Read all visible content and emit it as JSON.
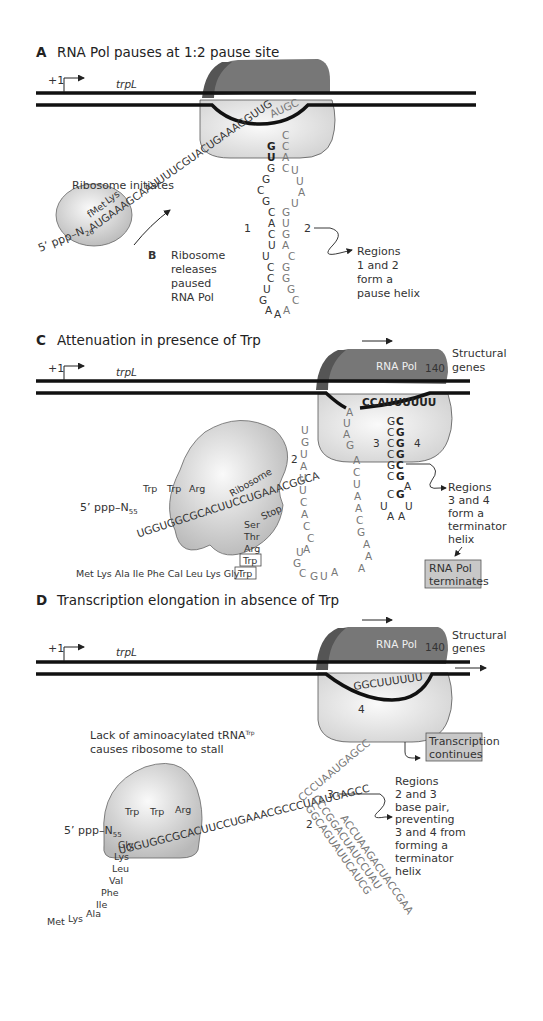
{
  "panels": {
    "A": {
      "letter": "A",
      "title": "RNA Pol pauses at 1:2 pause site",
      "plus_one": "+1",
      "gene": "trpL",
      "pol_seq": "AUGC",
      "transcript": "5’ ppp–N",
      "n_sub": "26",
      "strand_seq": "AUGAAAGCAAUUUUCGUACUGAAAGGUUG",
      "codon_labels": [
        "fMet",
        "Lys"
      ],
      "ribosome_label": "Ribosome initiates",
      "region1": "1",
      "region2": "2",
      "note": [
        "Regions",
        "1 and 2",
        "form a",
        "pause helix"
      ]
    },
    "B": {
      "letter": "B",
      "text": [
        "Ribosome",
        "releases",
        "paused",
        "RNA Pol"
      ]
    },
    "C": {
      "letter": "C",
      "title": "Attenuation in presence of Trp",
      "plus_one": "+1",
      "gene": "trpL",
      "pol_label": "RNA Pol",
      "pos": "140",
      "structural": [
        "Structural",
        "genes"
      ],
      "pol_seq": "CCAUUUUUU",
      "ribosome_label": "Ribosome",
      "transcript": "5’ ppp–N",
      "n_sub": "55",
      "seq": "UGGUGGCGCACUUCCUGAAACGGCA",
      "codons_top": [
        "Trp",
        "Trp",
        "Arg"
      ],
      "codons_right": [
        "Stop"
      ],
      "peptide_stack": [
        "Ser",
        "Thr",
        "Arg"
      ],
      "boxed_trp": "Trp",
      "peptide_line": "Met Lys Ala Ile Phe Cal Leu Lys Gly",
      "region2": "2",
      "region3": "3",
      "region4": "4",
      "note": [
        "Regions",
        "3 and 4",
        "form a",
        "terminator",
        "helix"
      ],
      "result_box": [
        "RNA Pol",
        "terminates"
      ]
    },
    "D": {
      "letter": "D",
      "title": "Transcription elongation in absence of Trp",
      "plus_one": "+1",
      "gene": "trpL",
      "pol_label": "RNA Pol",
      "pos": "140",
      "structural": [
        "Structural",
        "genes"
      ],
      "pol_seq": "GGCUUUUUU",
      "region4": "4",
      "stall_note": [
        "Lack of aminoacylated tRNA",
        "causes ribosome to stall"
      ],
      "stall_sup": "Trp",
      "transcript": "5’ ppp–N",
      "n_sub": "55",
      "seq": "UGGUGGCGCACUUCCUGAAACGCCCUAAUGAGCC",
      "codons_top": [
        "Trp",
        "Trp",
        "Arg"
      ],
      "peptide_stack": [
        "Gly",
        "Lys",
        "Leu",
        "Val",
        "Phe",
        "Ile",
        "Ala",
        "Lys",
        "Met"
      ],
      "region2": "2",
      "region3": "3",
      "result_box": [
        "Transcription",
        "continues"
      ],
      "note": [
        "Regions",
        "2 and 3",
        "base pair,",
        "preventing",
        "3 and 4 from",
        "forming a",
        "terminator",
        "helix"
      ]
    }
  },
  "colors": {
    "pol_dark": "#6e6e6e",
    "pol_darker": "#555555",
    "body_light": "#e4e4e4",
    "box_fill": "#c8c8c8",
    "dna": "#111111"
  }
}
